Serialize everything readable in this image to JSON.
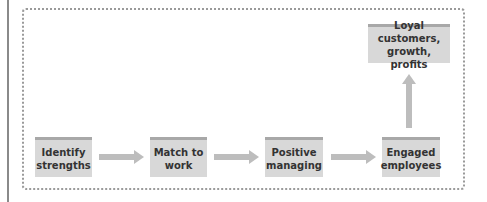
{
  "diagram": {
    "nodes": [
      {
        "id": "identify",
        "lines": [
          "Identify",
          "strengths"
        ]
      },
      {
        "id": "match",
        "lines": [
          "Match to",
          "work"
        ]
      },
      {
        "id": "positive",
        "lines": [
          "Positive",
          "managing"
        ]
      },
      {
        "id": "engaged",
        "lines": [
          "Engaged",
          "employees"
        ]
      },
      {
        "id": "loyal",
        "lines": [
          "Loyal customers,",
          "growth, profits"
        ]
      }
    ],
    "edges": [
      {
        "from": "identify",
        "to": "match"
      },
      {
        "from": "match",
        "to": "positive"
      },
      {
        "from": "positive",
        "to": "engaged"
      },
      {
        "from": "engaged",
        "to": "loyal"
      }
    ],
    "colors": {
      "box_fill": "#d8d8d8",
      "box_top": "#a8a8a8",
      "arrow": "#bdbdbd",
      "frame": "#9a9a9a"
    }
  }
}
